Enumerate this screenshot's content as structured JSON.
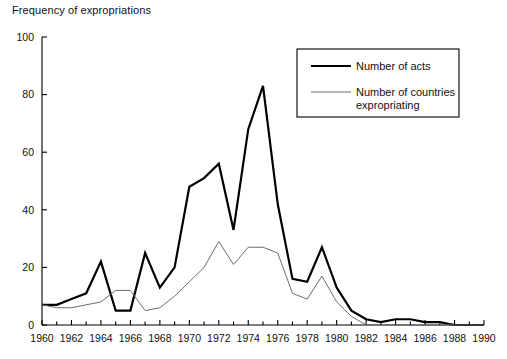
{
  "chart_data": {
    "type": "line",
    "title": "Frequency of expropriations",
    "xlabel": "",
    "ylabel": "",
    "xlim": [
      1960,
      1990
    ],
    "ylim": [
      0,
      100
    ],
    "yticks": [
      0,
      20,
      40,
      60,
      80,
      100
    ],
    "xticks": [
      1960,
      1962,
      1964,
      1966,
      1968,
      1970,
      1972,
      1974,
      1976,
      1978,
      1980,
      1982,
      1984,
      1986,
      1988,
      1990
    ],
    "xtick_labels": [
      "1960",
      "1962",
      "1964",
      "1966",
      "1968",
      "1970",
      "1972",
      "1974",
      "1976",
      "1978",
      "1980",
      "1982",
      "1984",
      "1986",
      "1988",
      "1990"
    ],
    "ytick_labels": [
      "0",
      "20",
      "40",
      "60",
      "80",
      "100"
    ],
    "x": [
      1960,
      1961,
      1962,
      1963,
      1964,
      1965,
      1966,
      1967,
      1968,
      1969,
      1970,
      1971,
      1972,
      1973,
      1974,
      1975,
      1976,
      1977,
      1978,
      1979,
      1980,
      1981,
      1982,
      1983,
      1984,
      1985,
      1986,
      1987,
      1988,
      1989,
      1990
    ],
    "grid": false,
    "legend_position": "upper right",
    "series": [
      {
        "name": "Number of acts",
        "values": [
          7,
          7,
          9,
          11,
          22,
          5,
          5,
          25,
          13,
          20,
          48,
          51,
          56,
          33,
          68,
          83,
          42,
          16,
          15,
          27,
          13,
          5,
          2,
          1,
          2,
          2,
          1,
          1,
          0,
          0,
          0
        ],
        "color": "#000000",
        "linewidth": 2.2
      },
      {
        "name": "Number of countries expropriating",
        "values": [
          7,
          6,
          6,
          7,
          8,
          12,
          12,
          5,
          6,
          10,
          15,
          20,
          29,
          21,
          27,
          27,
          25,
          11,
          9,
          17,
          8,
          3,
          0,
          0,
          0,
          0,
          0,
          0,
          0,
          0,
          0
        ],
        "color": "#6d6d6d",
        "linewidth": 1.0
      }
    ],
    "legend": [
      {
        "label": "Number of acts",
        "color": "#000000",
        "linewidth": 2.2
      },
      {
        "label": "Number of countries expropriating",
        "label_line1": "Number of countries",
        "label_line2": "expropriating",
        "color": "#6d6d6d",
        "linewidth": 1.0
      }
    ],
    "axis_color": "#000000"
  }
}
